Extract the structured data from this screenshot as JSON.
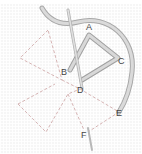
{
  "diagram": {
    "type": "embroidery-stitch-instruction",
    "points": [
      {
        "id": "A",
        "label": "A",
        "x": 89,
        "y": 27
      },
      {
        "id": "B",
        "label": "B",
        "x": 64,
        "y": 72
      },
      {
        "id": "C",
        "label": "C",
        "x": 120,
        "y": 61
      },
      {
        "id": "D",
        "label": "D",
        "x": 80,
        "y": 89
      },
      {
        "id": "E",
        "label": "E",
        "x": 119,
        "y": 112
      },
      {
        "id": "F",
        "label": "F",
        "x": 84,
        "y": 135
      }
    ],
    "colors": {
      "thread": "#c8c8c8",
      "thread_shadow": "#9a9a9a",
      "guide_lines": "#d8b8b8",
      "background": "#f6f6f6",
      "labels": "#444444"
    }
  }
}
